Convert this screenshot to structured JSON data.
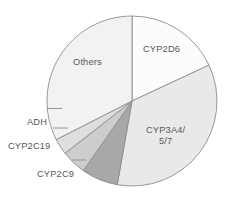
{
  "chart_data": {
    "type": "pie",
    "title": "",
    "subtitle": "",
    "xlabel": "",
    "ylabel": "",
    "legend_position": "none",
    "grid": false,
    "labels_inside": [
      "CYP2D6",
      "CYP3A4/\n5/7",
      "Others"
    ],
    "labels_outside": [
      "ADH",
      "CYP2C19",
      "CYP2C9"
    ],
    "categories": [
      "CYP2D6",
      "CYP3A4/5/7",
      "CYP2C9",
      "CYP2C19",
      "ADH",
      "Others"
    ],
    "values": [
      18,
      35,
      7,
      5,
      3,
      32
    ],
    "units": "percent of total",
    "slices": [
      {
        "name": "CYP2D6",
        "label": "CYP2D6",
        "value": 18,
        "start_angle": 0,
        "end_angle": 65,
        "color": "#fcfcfc",
        "label_placement": "inside"
      },
      {
        "name": "CYP3A4/5/7",
        "label": "CYP3A4/",
        "label_line2": "5/7",
        "value": 35,
        "start_angle": 65,
        "end_angle": 190,
        "color": "#e9e9e9",
        "label_placement": "inside"
      },
      {
        "name": "CYP2C9",
        "label": "CYP2C9",
        "value": 7,
        "start_angle": 190,
        "end_angle": 215,
        "color": "#a8a8a8",
        "label_placement": "outside"
      },
      {
        "name": "CYP2C19",
        "label": "CYP2C19",
        "value": 5,
        "start_angle": 215,
        "end_angle": 232,
        "color": "#cdcdcd",
        "label_placement": "outside"
      },
      {
        "name": "ADH",
        "label": "ADH",
        "value": 3,
        "start_angle": 232,
        "end_angle": 243,
        "color": "#dedede",
        "label_placement": "outside"
      },
      {
        "name": "Others",
        "label": "Others",
        "value": 32,
        "start_angle": 243,
        "end_angle": 360,
        "color": "#f2f2f2",
        "label_placement": "inside"
      }
    ],
    "geometry": {
      "center_x": 132,
      "center_y": 101,
      "radius": 85
    },
    "style": {
      "outline_color": "#8d8d8d",
      "text_color": "#575757",
      "background": "#ffffff"
    }
  }
}
